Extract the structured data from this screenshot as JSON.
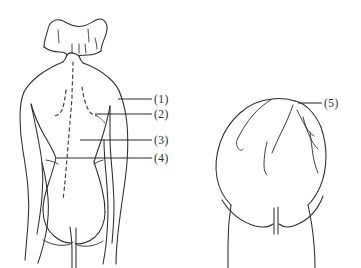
{
  "figure": {
    "background_color": "#ffffff",
    "line_color": "#2b2b2b",
    "dashed_line_color": "#3a3a3a",
    "panels": [
      {
        "name": "left-panel",
        "description": "Full posterior (back) view of a female upper body: head with hair, neck, shoulders, arms at sides, torso tapering to waist, gluteal cleft at the bottom. Dashed contour lines indicate the vertebral column and the medial borders of the scapulae."
      },
      {
        "name": "right-panel",
        "description": "Close-up posterior view of the lower back, buttocks and upper thighs with gluteal fold and cleft."
      }
    ],
    "labels": [
      {
        "id": "label-1",
        "text": "(1)",
        "number": "1",
        "leader_from_x": 118,
        "leader_to_x": 152,
        "leader_y": 99
      },
      {
        "id": "label-2",
        "text": "(2)",
        "number": "2",
        "leader_from_x": 95,
        "leader_to_x": 152,
        "leader_y": 114
      },
      {
        "id": "label-3",
        "text": "(3)",
        "number": "3",
        "leader_from_x": 80,
        "leader_to_x": 152,
        "leader_y": 140
      },
      {
        "id": "label-4",
        "text": "(4)",
        "number": "4",
        "leader_from_x": 57,
        "leader_to_x": 152,
        "leader_y": 158
      },
      {
        "id": "label-5",
        "text": "(5)",
        "number": "5",
        "leader_from_x": 298,
        "leader_to_x": 322,
        "leader_y": 103
      }
    ]
  }
}
